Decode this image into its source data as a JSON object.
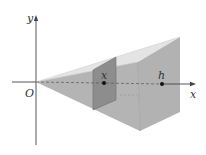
{
  "diagram": {
    "type": "pyramid-cross-section",
    "labels": {
      "y_axis": "y",
      "x_axis": "x",
      "origin": "O",
      "cross_section_point": "x",
      "height_point": "h"
    },
    "colors": {
      "background": "#ffffff",
      "top_face": "#e4e4e4",
      "side_face_left": "#b4b4b4",
      "front_face": "#a9a9a9",
      "base_face": "#b9b9b9",
      "cross_section": "#8d8d8d",
      "axis": "#444444",
      "dashed_axis": "#555555"
    }
  }
}
